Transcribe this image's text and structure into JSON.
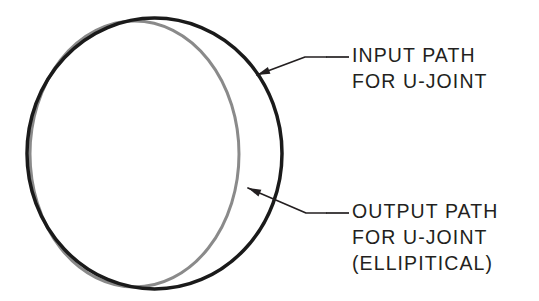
{
  "figure": {
    "background_color": "#ffffff",
    "kind": "engineering-line-diagram"
  },
  "shapes": {
    "input_path": {
      "name": "INPUT PATH",
      "geometry": "circle",
      "color": "#1a1a1a",
      "stroke_width": "3.5",
      "cx": "154.5",
      "cy": "153.5",
      "rx": "127.5",
      "ry": "135.5"
    },
    "output_path": {
      "name": "OUTPUT PATH",
      "geometry": "ellipse",
      "color": "#8a8a8a",
      "stroke_width": "3.0",
      "cx": "134.5",
      "cy": "154.0",
      "rx": "104.5",
      "ry": "133.0"
    }
  },
  "callouts": [
    {
      "id": "input-callout",
      "lines": [
        "INPUT PATH",
        "FOR U-JOINT"
      ],
      "text_x": 352,
      "text_y_first": 57,
      "line_height": 26,
      "leader": {
        "dash_x1": 326,
        "dash_y1": 57,
        "dash_x2": 349,
        "dash_y2": 57,
        "elbow_x": 305,
        "elbow_y": 57,
        "arrow_x": 257,
        "arrow_y": 75,
        "color": "#231f20",
        "stroke_width": "1.7"
      }
    },
    {
      "id": "output-callout",
      "lines": [
        "OUTPUT PATH",
        "FOR U-JOINT",
        "(ELLIPITICAL)"
      ],
      "text_x": 352,
      "text_y_first": 213,
      "line_height": 26,
      "leader": {
        "dash_x1": 326,
        "dash_y1": 213,
        "dash_x2": 349,
        "dash_y2": 213,
        "elbow_x": 306,
        "elbow_y": 213,
        "arrow_x": 248,
        "arrow_y": 188,
        "color": "#231f20",
        "stroke_width": "1.7"
      }
    }
  ]
}
